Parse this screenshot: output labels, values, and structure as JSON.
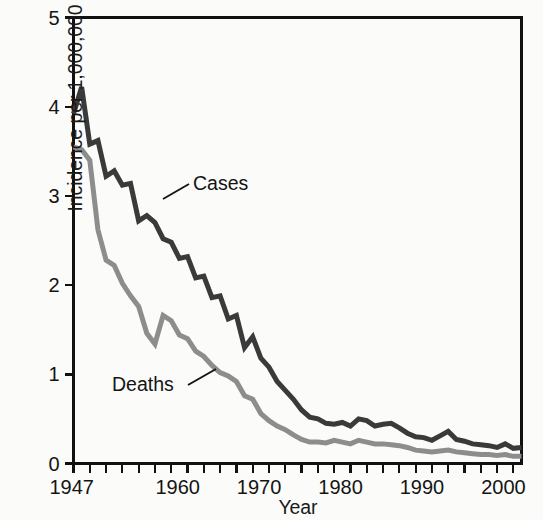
{
  "chart_data": {
    "type": "line",
    "title": "",
    "xlabel": "Year",
    "ylabel": "Incidence per 1,000,000",
    "xlim": [
      1947,
      2002
    ],
    "ylim": [
      0,
      5
    ],
    "xticks_major": [
      1947,
      1960,
      1970,
      1980,
      1990,
      2000
    ],
    "xtick_labels": [
      "1947",
      "1960",
      "1970",
      "1980",
      "1990",
      "2000"
    ],
    "xtick_minor_step": 2,
    "yticks": [
      0,
      1,
      2,
      3,
      4,
      5
    ],
    "ytick_labels": [
      "0",
      "1",
      "2",
      "3",
      "4",
      "5"
    ],
    "grid": false,
    "legend_position": "inline-annotations",
    "x": [
      1947,
      1948,
      1949,
      1950,
      1951,
      1952,
      1953,
      1954,
      1955,
      1956,
      1957,
      1958,
      1959,
      1960,
      1961,
      1962,
      1963,
      1964,
      1965,
      1966,
      1967,
      1968,
      1969,
      1970,
      1971,
      1972,
      1973,
      1974,
      1975,
      1976,
      1977,
      1978,
      1979,
      1980,
      1981,
      1982,
      1983,
      1984,
      1985,
      1986,
      1987,
      1988,
      1989,
      1990,
      1991,
      1992,
      1993,
      1994,
      1995,
      1996,
      1997,
      1998,
      1999,
      2000,
      2001,
      2002
    ],
    "series": [
      {
        "name": "Cases",
        "color": "#3a3a3a",
        "values": [
          3.92,
          4.22,
          3.58,
          3.62,
          3.22,
          3.28,
          3.12,
          3.14,
          2.72,
          2.78,
          2.7,
          2.52,
          2.48,
          2.3,
          2.32,
          2.08,
          2.1,
          1.86,
          1.88,
          1.62,
          1.66,
          1.3,
          1.42,
          1.18,
          1.08,
          0.92,
          0.82,
          0.72,
          0.6,
          0.52,
          0.5,
          0.45,
          0.44,
          0.46,
          0.42,
          0.5,
          0.48,
          0.42,
          0.44,
          0.45,
          0.4,
          0.34,
          0.3,
          0.29,
          0.26,
          0.31,
          0.36,
          0.27,
          0.25,
          0.22,
          0.21,
          0.2,
          0.18,
          0.22,
          0.17,
          0.18
        ]
      },
      {
        "name": "Deaths",
        "color": "#8d8d8d",
        "values": [
          3.55,
          3.52,
          3.4,
          2.62,
          2.28,
          2.22,
          2.02,
          1.88,
          1.76,
          1.46,
          1.34,
          1.66,
          1.6,
          1.44,
          1.4,
          1.26,
          1.2,
          1.1,
          1.02,
          0.98,
          0.92,
          0.76,
          0.72,
          0.56,
          0.48,
          0.42,
          0.38,
          0.32,
          0.27,
          0.24,
          0.24,
          0.23,
          0.26,
          0.24,
          0.22,
          0.26,
          0.24,
          0.22,
          0.22,
          0.21,
          0.2,
          0.18,
          0.15,
          0.14,
          0.13,
          0.14,
          0.15,
          0.13,
          0.12,
          0.11,
          0.1,
          0.1,
          0.09,
          0.1,
          0.08,
          0.08
        ]
      }
    ],
    "annotations": [
      {
        "text": "Cases",
        "x": 1958.6,
        "y": 3.0
      },
      {
        "text": "Deaths",
        "x": 1951.0,
        "y": 0.88
      }
    ]
  },
  "axes": {
    "frame_color": "#111111"
  }
}
